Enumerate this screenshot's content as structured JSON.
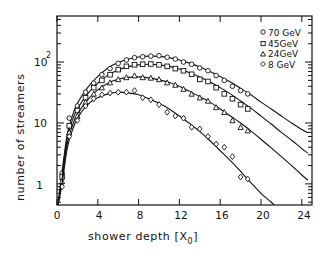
{
  "chart_data": {
    "type": "scatter",
    "title": "",
    "xlabel": "shower depth [X0]",
    "ylabel": "number of streamers",
    "xscale": "linear",
    "yscale": "log",
    "xlim": [
      0,
      25
    ],
    "ylim": [
      0.45,
      570
    ],
    "xticks": [
      0,
      4,
      8,
      12,
      16,
      20,
      24
    ],
    "xtick_labels": [
      "0",
      "4",
      "8",
      "12",
      "16",
      "20",
      "24"
    ],
    "yticks": [
      1,
      10,
      100
    ],
    "ytick_labels": [
      "1",
      "10",
      "10²"
    ],
    "grid": false,
    "legend_position": "upper right",
    "series": [
      {
        "name": "70 GeV",
        "marker": "circle",
        "points": [
          [
            0.5,
            1.5
          ],
          [
            1.2,
            12
          ],
          [
            2.0,
            19
          ],
          [
            2.8,
            32
          ],
          [
            3.6,
            45
          ],
          [
            4.4,
            62
          ],
          [
            5.2,
            78
          ],
          [
            6.0,
            95
          ],
          [
            6.8,
            108
          ],
          [
            7.6,
            118
          ],
          [
            8.4,
            122
          ],
          [
            9.2,
            125
          ],
          [
            10.0,
            127
          ],
          [
            10.8,
            120
          ],
          [
            11.6,
            112
          ],
          [
            12.4,
            100
          ],
          [
            13.2,
            92
          ],
          [
            14.0,
            80
          ],
          [
            14.8,
            72
          ],
          [
            15.6,
            60
          ],
          [
            16.4,
            50
          ],
          [
            17.2,
            40
          ],
          [
            18.0,
            34
          ],
          [
            18.7,
            30
          ]
        ],
        "fit": [
          [
            0.1,
            0.45
          ],
          [
            0.5,
            1.6
          ],
          [
            1.0,
            6.5
          ],
          [
            1.5,
            13
          ],
          [
            2,
            21
          ],
          [
            3,
            38
          ],
          [
            4,
            58
          ],
          [
            5,
            80
          ],
          [
            6,
            98
          ],
          [
            7,
            112
          ],
          [
            8,
            121
          ],
          [
            9,
            125
          ],
          [
            10,
            124
          ],
          [
            11,
            118
          ],
          [
            12,
            108
          ],
          [
            13,
            96
          ],
          [
            14,
            83
          ],
          [
            15,
            70
          ],
          [
            16,
            58
          ],
          [
            17,
            47
          ],
          [
            18,
            37
          ],
          [
            19,
            29
          ],
          [
            20,
            22
          ],
          [
            21,
            17
          ],
          [
            22,
            13
          ],
          [
            23,
            10
          ],
          [
            24,
            7.8
          ],
          [
            24.6,
            6.9
          ]
        ]
      },
      {
        "name": "45 GeV",
        "marker": "square",
        "points": [
          [
            0.5,
            1.3
          ],
          [
            1.2,
            9
          ],
          [
            2.0,
            16
          ],
          [
            2.8,
            26
          ],
          [
            3.6,
            38
          ],
          [
            4.4,
            50
          ],
          [
            5.2,
            62
          ],
          [
            6.0,
            75
          ],
          [
            6.8,
            85
          ],
          [
            7.6,
            90
          ],
          [
            8.4,
            92
          ],
          [
            9.2,
            93
          ],
          [
            10.0,
            90
          ],
          [
            10.8,
            85
          ],
          [
            11.6,
            78
          ],
          [
            12.4,
            72
          ],
          [
            13.2,
            63
          ],
          [
            14.0,
            52
          ],
          [
            14.8,
            48
          ],
          [
            15.6,
            38
          ],
          [
            16.4,
            30
          ],
          [
            17.2,
            25
          ],
          [
            18.0,
            20
          ],
          [
            18.7,
            17
          ]
        ],
        "fit": [
          [
            0.1,
            0.45
          ],
          [
            0.5,
            1.4
          ],
          [
            1.0,
            5.5
          ],
          [
            1.5,
            11
          ],
          [
            2,
            17
          ],
          [
            3,
            30
          ],
          [
            4,
            45
          ],
          [
            5,
            61
          ],
          [
            6,
            74
          ],
          [
            7,
            84
          ],
          [
            8,
            90
          ],
          [
            9,
            92
          ],
          [
            10,
            90
          ],
          [
            11,
            85
          ],
          [
            12,
            77
          ],
          [
            13,
            67
          ],
          [
            14,
            57
          ],
          [
            15,
            47
          ],
          [
            16,
            38
          ],
          [
            17,
            30
          ],
          [
            18,
            23
          ],
          [
            19,
            17.5
          ],
          [
            20,
            13
          ],
          [
            21,
            9.6
          ],
          [
            22,
            7
          ],
          [
            23,
            5.2
          ],
          [
            24,
            3.8
          ],
          [
            24.6,
            3.2
          ]
        ]
      },
      {
        "name": "24 GeV",
        "marker": "triangle",
        "points": [
          [
            0.5,
            1.1
          ],
          [
            1.2,
            7
          ],
          [
            2.0,
            13
          ],
          [
            2.8,
            22
          ],
          [
            3.6,
            30
          ],
          [
            4.4,
            38
          ],
          [
            5.2,
            46
          ],
          [
            6.0,
            52
          ],
          [
            6.8,
            56
          ],
          [
            7.6,
            60
          ],
          [
            8.4,
            56
          ],
          [
            9.2,
            55
          ],
          [
            10.0,
            52
          ],
          [
            10.8,
            46
          ],
          [
            11.6,
            42
          ],
          [
            12.4,
            36
          ],
          [
            13.2,
            30
          ],
          [
            14.0,
            26
          ],
          [
            14.8,
            23
          ],
          [
            15.6,
            18
          ],
          [
            16.4,
            15
          ],
          [
            17.2,
            11
          ],
          [
            18.0,
            8.5
          ],
          [
            18.7,
            7.5
          ]
        ],
        "fit": [
          [
            0.1,
            0.45
          ],
          [
            0.5,
            1.2
          ],
          [
            1.0,
            4.5
          ],
          [
            1.5,
            9
          ],
          [
            2,
            14
          ],
          [
            3,
            24
          ],
          [
            4,
            35
          ],
          [
            5,
            45
          ],
          [
            6,
            52
          ],
          [
            7,
            56
          ],
          [
            8,
            57
          ],
          [
            9,
            55
          ],
          [
            10,
            51
          ],
          [
            11,
            46
          ],
          [
            12,
            40
          ],
          [
            13,
            33
          ],
          [
            14,
            27
          ],
          [
            15,
            22
          ],
          [
            16,
            17
          ],
          [
            17,
            13
          ],
          [
            18,
            10
          ],
          [
            19,
            7.4
          ],
          [
            20,
            5.4
          ],
          [
            21,
            3.9
          ],
          [
            22,
            2.8
          ],
          [
            23,
            2
          ],
          [
            24,
            1.4
          ],
          [
            24.6,
            1.15
          ]
        ]
      },
      {
        "name": "8 GeV",
        "marker": "diamond",
        "points": [
          [
            0.5,
            0.9
          ],
          [
            1.2,
            6
          ],
          [
            2.0,
            11
          ],
          [
            2.8,
            19
          ],
          [
            3.6,
            25
          ],
          [
            4.4,
            29
          ],
          [
            5.2,
            31
          ],
          [
            6.0,
            32
          ],
          [
            6.8,
            32
          ],
          [
            7.6,
            34
          ],
          [
            8.4,
            26
          ],
          [
            9.2,
            24
          ],
          [
            10.0,
            20
          ],
          [
            10.8,
            15
          ],
          [
            11.6,
            13
          ],
          [
            12.4,
            12
          ],
          [
            13.2,
            8.5
          ],
          [
            14.0,
            8
          ],
          [
            14.8,
            6
          ],
          [
            15.6,
            4.5
          ],
          [
            16.4,
            4
          ],
          [
            17.2,
            2.8
          ],
          [
            18.0,
            1.3
          ],
          [
            18.7,
            1.2
          ]
        ],
        "fit": [
          [
            0.1,
            0.45
          ],
          [
            0.5,
            1.0
          ],
          [
            1.0,
            3.8
          ],
          [
            1.5,
            7.5
          ],
          [
            2,
            12
          ],
          [
            3,
            20
          ],
          [
            4,
            26
          ],
          [
            5,
            30
          ],
          [
            6,
            32
          ],
          [
            7,
            31
          ],
          [
            8,
            29
          ],
          [
            9,
            25
          ],
          [
            10,
            21
          ],
          [
            11,
            17
          ],
          [
            12,
            13
          ],
          [
            13,
            9.8
          ],
          [
            14,
            7.2
          ],
          [
            15,
            5.1
          ],
          [
            16,
            3.5
          ],
          [
            17,
            2.4
          ],
          [
            18,
            1.6
          ],
          [
            19,
            1.05
          ],
          [
            20,
            0.7
          ],
          [
            21,
            0.5
          ],
          [
            21.3,
            0.45
          ]
        ]
      }
    ]
  },
  "legend": {
    "items": [
      {
        "label": "70 GeV",
        "marker": "circle"
      },
      {
        "label": "45GeV",
        "marker": "square"
      },
      {
        "label": "24GeV",
        "marker": "triangle"
      },
      {
        "label": "8 GeV",
        "marker": "diamond"
      }
    ]
  },
  "axes": {
    "xlabel_main": "shower depth [X",
    "xlabel_sub": "0",
    "xlabel_close": "]",
    "ylabel": "number of streamers",
    "xtick_labels": [
      "0",
      "4",
      "8",
      "12",
      "16",
      "20",
      "24"
    ],
    "ytick_1": "1",
    "ytick_10": "10",
    "ytick_100_base": "10",
    "ytick_100_exp": "2"
  }
}
